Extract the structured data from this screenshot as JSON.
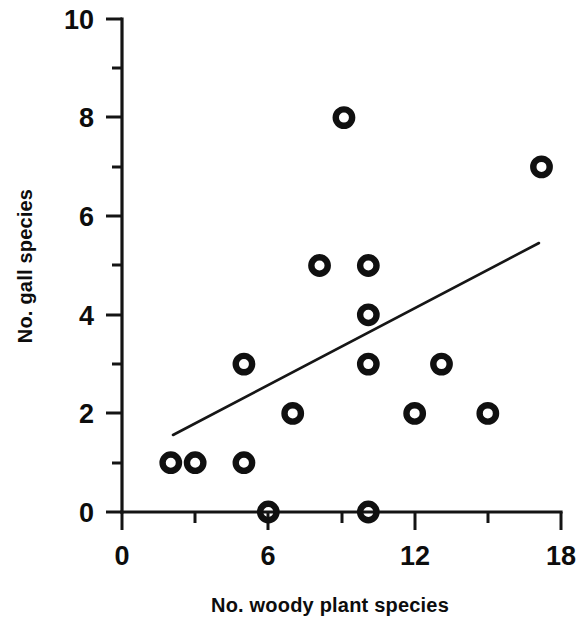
{
  "chart_data": {
    "type": "scatter",
    "title": "",
    "xlabel": "No. woody plant species",
    "ylabel": "No. gall species",
    "xlim": [
      0,
      18
    ],
    "ylim": [
      0,
      10
    ],
    "xticks": [
      0,
      6,
      12,
      18
    ],
    "yticks": [
      0,
      2,
      4,
      6,
      8,
      10
    ],
    "xtick_labels": [
      "0",
      "6",
      "12",
      "18"
    ],
    "ytick_labels": [
      "0",
      "2",
      "4",
      "6",
      "8",
      "10"
    ],
    "x_minor_ticks": [
      3,
      9,
      15
    ],
    "y_minor_ticks": [
      1,
      3,
      5,
      7,
      9
    ],
    "grid": false,
    "legend": null,
    "marker_style": "open-circle",
    "marker_color": "#101010",
    "points": [
      {
        "x": 2.0,
        "y": 1
      },
      {
        "x": 3.0,
        "y": 1
      },
      {
        "x": 5.0,
        "y": 1
      },
      {
        "x": 5.0,
        "y": 3
      },
      {
        "x": 6.0,
        "y": 0
      },
      {
        "x": 7.0,
        "y": 2
      },
      {
        "x": 8.1,
        "y": 5
      },
      {
        "x": 9.1,
        "y": 8
      },
      {
        "x": 10.1,
        "y": 5
      },
      {
        "x": 10.1,
        "y": 4
      },
      {
        "x": 10.1,
        "y": 3
      },
      {
        "x": 10.1,
        "y": 0
      },
      {
        "x": 12.0,
        "y": 2
      },
      {
        "x": 13.1,
        "y": 3
      },
      {
        "x": 15.0,
        "y": 2
      },
      {
        "x": 17.2,
        "y": 7
      }
    ],
    "trend_line": {
      "type": "linear-fit",
      "x_start": 2.1,
      "y_start": 1.55,
      "x_end": 17.1,
      "y_end": 5.4
    }
  }
}
